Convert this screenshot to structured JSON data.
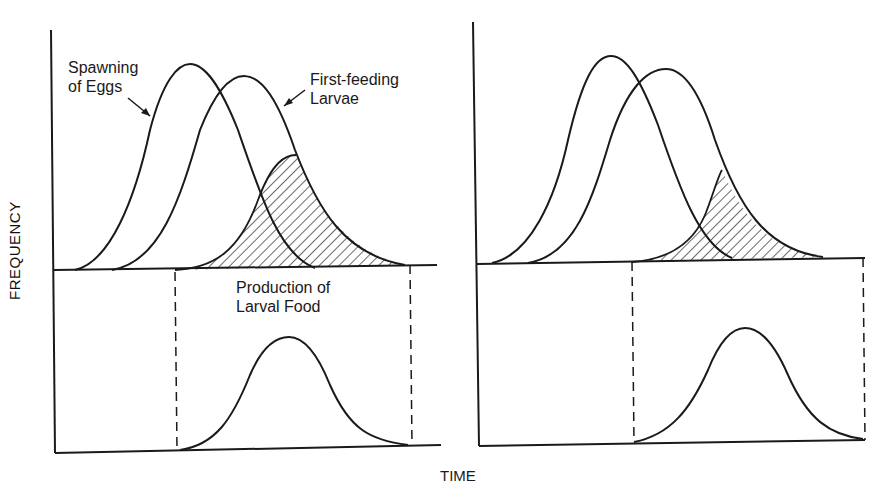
{
  "diagram": {
    "y_axis_label": "FREQUENCY",
    "x_axis_label": "TIME",
    "labels": {
      "spawning_line1": "Spawning",
      "spawning_line2": "of Eggs",
      "larvae_line1": "First-feeding",
      "larvae_line2": "Larvae",
      "food_line1": "Production of",
      "food_line2": "Larval Food"
    },
    "panels": [
      {
        "name": "left",
        "description": "Larvae hatch overlapping food production window (large shaded overlap)"
      },
      {
        "name": "right",
        "description": "Larvae hatch earlier than food production (small shaded overlap)"
      }
    ],
    "colors": {
      "ink": "#1a1a1a",
      "background": "#ffffff"
    }
  }
}
